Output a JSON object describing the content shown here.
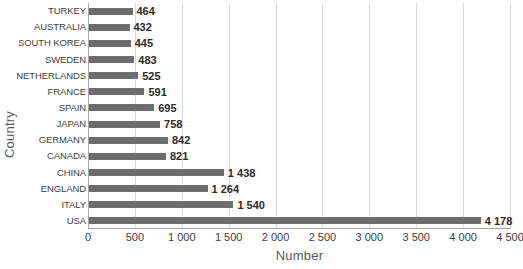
{
  "chart_data": {
    "type": "bar",
    "orientation": "horizontal",
    "title": "",
    "xlabel": "Number",
    "ylabel": "Country",
    "categories": [
      "TURKEY",
      "AUSTRALIA",
      "SOUTH KOREA",
      "SWEDEN",
      "NETHERLANDS",
      "FRANCE",
      "SPAIN",
      "JAPAN",
      "GERMANY",
      "CANADA",
      "CHINA",
      "ENGLAND",
      "ITALY",
      "USA"
    ],
    "values": [
      464,
      432,
      445,
      483,
      525,
      591,
      695,
      758,
      842,
      821,
      1438,
      1264,
      1540,
      4178
    ],
    "value_labels": [
      "464",
      "432",
      "445",
      "483",
      "525",
      "591",
      "695",
      "758",
      "842",
      "821",
      "1 438",
      "1 264",
      "1 540",
      "4 178"
    ],
    "xlim": [
      0,
      4500
    ],
    "xticks": [
      0,
      500,
      1000,
      1500,
      2000,
      2500,
      3000,
      3500,
      4000,
      4500
    ],
    "xtick_labels": [
      "0",
      "500",
      "1 000",
      "1 500",
      "2 000",
      "2 500",
      "3 000",
      "3 500",
      "4 000",
      "4 500"
    ],
    "grid": true,
    "grid_axis": "x",
    "legend": false,
    "bar_color": "#6e6e6e",
    "grid_color": "#d9d9d9",
    "axis_color": "#a6a6a6",
    "background": "#ffffff"
  }
}
